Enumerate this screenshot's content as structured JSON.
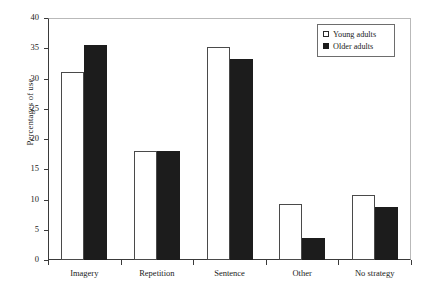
{
  "chart_data": {
    "type": "bar",
    "title": "",
    "xlabel": "",
    "ylabel": "Percentages of use",
    "categories": [
      "Imagery",
      "Repetition",
      "Sentence",
      "Other",
      "No strategy"
    ],
    "series": [
      {
        "name": "Young adults",
        "values": [
          31.0,
          18.0,
          35.2,
          9.3,
          10.7
        ],
        "color": "#ffffff",
        "swatch": "open-square"
      },
      {
        "name": "Older adults",
        "values": [
          35.5,
          18.0,
          33.2,
          3.7,
          8.8
        ],
        "color": "#1c1c1c",
        "swatch": "filled-square"
      }
    ],
    "ylim": [
      0,
      40
    ],
    "ytick_step": 5,
    "yticks": [
      0,
      5,
      10,
      15,
      20,
      25,
      30,
      35,
      40
    ],
    "ytick_labels": [
      "0",
      "5",
      "10",
      "15",
      "20",
      "25",
      "30",
      "35",
      "40"
    ],
    "grid": false,
    "legend_position": "top-right"
  },
  "legend": {
    "entries": [
      {
        "label": "Young adults"
      },
      {
        "label": "Older adults"
      }
    ]
  }
}
